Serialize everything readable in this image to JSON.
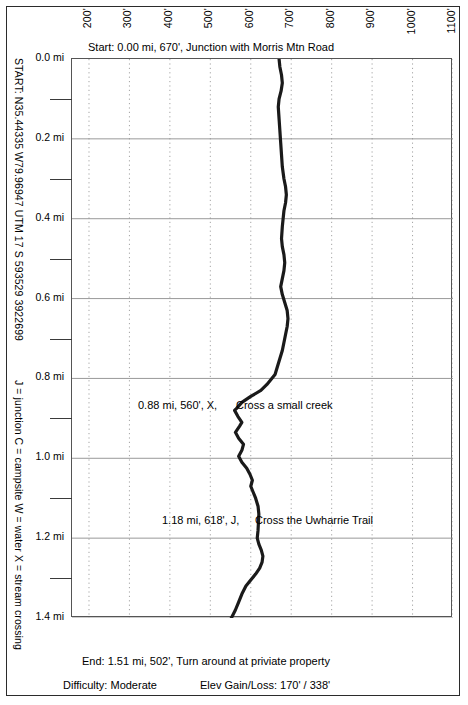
{
  "figure": {
    "start_caption": "Start: 0.00 mi, 670', Junction with Morris Mtn Road",
    "end_caption": "End: 1.51 mi, 502', Turn around at priviate property",
    "difficulty": "Difficulty: Moderate",
    "gain_loss": "Elev Gain/Loss: 170' / 338'",
    "start_coords": "START: N35.44335 W79.96947   UTM 17 S 593529 3922699",
    "legend_key": "J = junction   C = campsite   W = water   X = stream crossing",
    "trace_color": "#1a1a1a",
    "grid_color": "#9a9a9a",
    "frame_color": "#555555"
  },
  "waypoints": [
    {
      "label": "0.88 mi, 560', X,",
      "description": "Cross a small creek",
      "mile": 0.88,
      "elevation": 560,
      "marker": "X",
      "label_x": 138,
      "label_y": 399,
      "desc_x": 236,
      "desc_y": 399
    },
    {
      "label": "1.18 mi, 618', J,",
      "description": "Cross the Uwharrie Trail",
      "mile": 1.18,
      "elevation": 618,
      "marker": "J",
      "label_x": 162,
      "label_y": 514,
      "desc_x": 255,
      "desc_y": 514
    }
  ],
  "chart_data": {
    "type": "line",
    "orientation": "vertical-distance",
    "xlabel": "Elevation (feet)",
    "ylabel": "Distance (miles)",
    "xlim": [
      158,
      1100
    ],
    "ylim": [
      0.0,
      1.51
    ],
    "grid": true,
    "legend": "none",
    "x_ticks": [
      200,
      300,
      400,
      500,
      600,
      700,
      800,
      900,
      1000,
      1100
    ],
    "x_tick_labels": [
      "200'",
      "300'",
      "400'",
      "500'",
      "600'",
      "700'",
      "800'",
      "900'",
      "1000'",
      "1100'"
    ],
    "y_ticks": [
      0.0,
      0.2,
      0.4,
      0.6,
      0.8,
      1.0,
      1.2,
      1.4
    ],
    "y_tick_labels": [
      "0.0 mi",
      "0.2 mi",
      "0.4 mi",
      "0.6 mi",
      "0.8 mi",
      "1.0 mi",
      "1.2 mi",
      "1.4 mi"
    ],
    "y_minor_ticks": [
      0.1,
      0.3,
      0.5,
      0.7,
      0.9,
      1.1,
      1.3,
      1.5
    ],
    "series": [
      {
        "name": "Elevation",
        "points": [
          [
            0.0,
            670
          ],
          [
            0.02,
            672
          ],
          [
            0.04,
            676
          ],
          [
            0.06,
            678
          ],
          [
            0.08,
            675
          ],
          [
            0.1,
            670
          ],
          [
            0.12,
            668
          ],
          [
            0.15,
            670
          ],
          [
            0.18,
            672
          ],
          [
            0.21,
            674
          ],
          [
            0.24,
            676
          ],
          [
            0.27,
            678
          ],
          [
            0.3,
            682
          ],
          [
            0.32,
            686
          ],
          [
            0.34,
            688
          ],
          [
            0.36,
            686
          ],
          [
            0.38,
            682
          ],
          [
            0.4,
            680
          ],
          [
            0.42,
            678
          ],
          [
            0.45,
            676
          ],
          [
            0.47,
            678
          ],
          [
            0.49,
            682
          ],
          [
            0.51,
            684
          ],
          [
            0.53,
            682
          ],
          [
            0.55,
            678
          ],
          [
            0.57,
            674
          ],
          [
            0.59,
            678
          ],
          [
            0.61,
            684
          ],
          [
            0.63,
            690
          ],
          [
            0.65,
            692
          ],
          [
            0.67,
            690
          ],
          [
            0.69,
            686
          ],
          [
            0.71,
            682
          ],
          [
            0.73,
            678
          ],
          [
            0.75,
            672
          ],
          [
            0.77,
            666
          ],
          [
            0.79,
            660
          ],
          [
            0.8,
            652
          ],
          [
            0.815,
            640
          ],
          [
            0.83,
            625
          ],
          [
            0.845,
            600
          ],
          [
            0.86,
            578
          ],
          [
            0.875,
            565
          ],
          [
            0.88,
            560
          ],
          [
            0.895,
            568
          ],
          [
            0.91,
            578
          ],
          [
            0.92,
            572
          ],
          [
            0.935,
            562
          ],
          [
            0.95,
            570
          ],
          [
            0.965,
            582
          ],
          [
            0.98,
            578
          ],
          [
            0.995,
            570
          ],
          [
            1.01,
            578
          ],
          [
            1.025,
            590
          ],
          [
            1.04,
            598
          ],
          [
            1.055,
            604
          ],
          [
            1.07,
            600
          ],
          [
            1.085,
            606
          ],
          [
            1.1,
            612
          ],
          [
            1.12,
            618
          ],
          [
            1.14,
            620
          ],
          [
            1.16,
            619
          ],
          [
            1.18,
            618
          ],
          [
            1.2,
            616
          ],
          [
            1.215,
            620
          ],
          [
            1.23,
            626
          ],
          [
            1.245,
            630
          ],
          [
            1.26,
            628
          ],
          [
            1.275,
            622
          ],
          [
            1.29,
            612
          ],
          [
            1.305,
            600
          ],
          [
            1.32,
            588
          ],
          [
            1.34,
            578
          ],
          [
            1.36,
            570
          ],
          [
            1.38,
            562
          ],
          [
            1.4,
            552
          ],
          [
            1.42,
            540
          ],
          [
            1.44,
            528
          ],
          [
            1.46,
            518
          ],
          [
            1.48,
            508
          ],
          [
            1.5,
            503
          ],
          [
            1.51,
            502
          ]
        ]
      }
    ],
    "annotations": [
      {
        "mile": 0.0,
        "elevation": 670,
        "text": "Start: 0.00 mi, 670', Junction with Morris Mtn Road"
      },
      {
        "mile": 0.88,
        "elevation": 560,
        "text": "0.88 mi, 560', X, Cross a small creek"
      },
      {
        "mile": 1.18,
        "elevation": 618,
        "text": "1.18 mi, 618', J, Cross the Uwharrie Trail"
      },
      {
        "mile": 1.51,
        "elevation": 502,
        "text": "End: 1.51 mi, 502', Turn around at priviate property"
      }
    ]
  }
}
